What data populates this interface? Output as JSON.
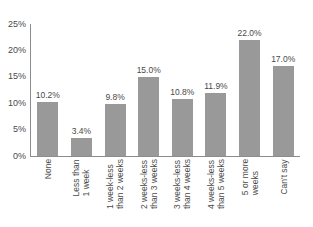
{
  "chart_data": {
    "type": "bar",
    "title": "",
    "subtitle": "",
    "xlabel": "",
    "ylabel": "",
    "ylim": [
      0,
      25
    ],
    "y_unit": "%",
    "grid": false,
    "legend": false,
    "orientation": "vertical",
    "bar_color": "#999999",
    "axis_color": "#8c8c8c",
    "text_color": "#4a4a4a",
    "background_color": "#ffffff",
    "label_rotation_degrees": 90,
    "y_ticks": [
      "0%",
      "5%",
      "10%",
      "15%",
      "20%",
      "25%"
    ],
    "y_tick_values": [
      0,
      5,
      10,
      15,
      20,
      25
    ],
    "categories": [
      "None",
      "Less than 1 week",
      "1 week-less than 2 weeks",
      "2 weeks-less than 3 weeks",
      "3 weeks-less than 4 weeks",
      "4 weeks-less than 5 weeks",
      "5 or more weeks",
      "Can't say"
    ],
    "category_lines": [
      [
        "None"
      ],
      [
        "Less than",
        "1 week"
      ],
      [
        "1 week-less",
        "than 2 weeks"
      ],
      [
        "2 weeks-less",
        "than 3 weeks"
      ],
      [
        "3 weeks-less",
        "than 4 weeks"
      ],
      [
        "4 weeks-less",
        "than 5 weeks"
      ],
      [
        "5 or more",
        "weeks"
      ],
      [
        "Can't say"
      ]
    ],
    "values": [
      10.2,
      3.4,
      9.8,
      15.0,
      10.8,
      11.9,
      22.0,
      17.0
    ],
    "value_labels": [
      "10.2%",
      "3.4%",
      "9.8%",
      "15.0%",
      "10.8%",
      "11.9%",
      "22.0%",
      "17.0%"
    ]
  }
}
